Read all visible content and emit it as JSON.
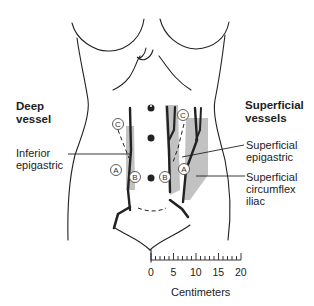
{
  "labels": {
    "deep_vessel": "Deep\nvessel",
    "inferior_epigastric": "Inferior\nepigastric",
    "superficial_vessels": "Superficial\nvessels",
    "superficial_epigastric": "Superficial\nepigastric",
    "superficial_circumflex_iliac": "Superficial\ncircumflex\niliac"
  },
  "markers": {
    "a": "A",
    "b": "B",
    "c": "C"
  },
  "scale": {
    "ticks": [
      "0",
      "5",
      "10",
      "15",
      "20"
    ],
    "unit": "Centimeters",
    "max": 20
  },
  "colors": {
    "line": "#222222",
    "shade": "#b5b5b5"
  }
}
